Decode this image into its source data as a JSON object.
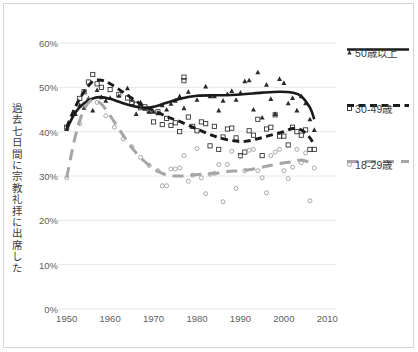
{
  "chart_data": {
    "type": "scatter",
    "title": "",
    "xlabel": "",
    "ylabel": "過去七日間に宗教礼拝に出席した",
    "xlim": [
      1948,
      2012
    ],
    "ylim": [
      0,
      60
    ],
    "grid": true,
    "grid_axis": "y",
    "legend_position": "right",
    "x_ticks": [
      "1950",
      "1960",
      "1970",
      "1980",
      "1990",
      "2000",
      "2010"
    ],
    "x_tick_values": [
      1950,
      1960,
      1970,
      1980,
      1990,
      2000,
      2010
    ],
    "y_ticks": [
      "0%",
      "10%",
      "20%",
      "30%",
      "40%",
      "50%",
      "60%"
    ],
    "y_tick_values": [
      0,
      10,
      20,
      30,
      40,
      50,
      60
    ],
    "series": [
      {
        "name": "50歳以上",
        "color": "#1a1a1a",
        "line_style": "solid",
        "marker": "triangle",
        "points": [
          [
            1950,
            40.6
          ],
          [
            1952,
            44.0
          ],
          [
            1953,
            46.0
          ],
          [
            1954,
            45.4
          ],
          [
            1955,
            47.5
          ],
          [
            1956,
            44.8
          ],
          [
            1957,
            49.4
          ],
          [
            1958,
            47.8
          ],
          [
            1959,
            47.0
          ],
          [
            1960,
            47.6
          ],
          [
            1962,
            48.1
          ],
          [
            1964,
            49.8
          ],
          [
            1965,
            47.2
          ],
          [
            1966,
            44.0
          ],
          [
            1967,
            46.6
          ],
          [
            1968,
            45.2
          ],
          [
            1969,
            44.5
          ],
          [
            1970,
            44.5
          ],
          [
            1971,
            44.2
          ],
          [
            1972,
            46.0
          ],
          [
            1973,
            45.0
          ],
          [
            1974,
            46.3
          ],
          [
            1975,
            47.0
          ],
          [
            1976,
            48.0
          ],
          [
            1977,
            45.3
          ],
          [
            1978,
            49.0
          ],
          [
            1980,
            47.2
          ],
          [
            1982,
            50.2
          ],
          [
            1983,
            48.0
          ],
          [
            1984,
            48.0
          ],
          [
            1985,
            44.8
          ],
          [
            1986,
            47.0
          ],
          [
            1987,
            48.5
          ],
          [
            1988,
            49.2
          ],
          [
            1989,
            47.2
          ],
          [
            1990,
            48.8
          ],
          [
            1991,
            51.4
          ],
          [
            1992,
            51.6
          ],
          [
            1993,
            45.0
          ],
          [
            1994,
            53.4
          ],
          [
            1995,
            43.2
          ],
          [
            1996,
            50.6
          ],
          [
            1997,
            47.4
          ],
          [
            1998,
            44.0
          ],
          [
            1999,
            51.9
          ],
          [
            2000,
            51.0
          ],
          [
            2001,
            46.4
          ],
          [
            2002,
            47.6
          ],
          [
            2003,
            44.8
          ],
          [
            2004,
            48.0
          ],
          [
            2005,
            46.4
          ],
          [
            2006,
            42.8
          ],
          [
            2007,
            40.4
          ]
        ],
        "trend": [
          [
            1950,
            40.6
          ],
          [
            1952,
            44.3
          ],
          [
            1954,
            46.4
          ],
          [
            1956,
            47.5
          ],
          [
            1958,
            47.8
          ],
          [
            1960,
            47.4
          ],
          [
            1963,
            46.4
          ],
          [
            1966,
            45.6
          ],
          [
            1968,
            45.4
          ],
          [
            1970,
            45.6
          ],
          [
            1973,
            46.5
          ],
          [
            1976,
            47.4
          ],
          [
            1980,
            48.1
          ],
          [
            1985,
            48.2
          ],
          [
            1990,
            48.4
          ],
          [
            1995,
            48.8
          ],
          [
            1999,
            49.0
          ],
          [
            2002,
            48.8
          ],
          [
            2004,
            48.0
          ],
          [
            2006,
            45.4
          ],
          [
            2007,
            42.8
          ]
        ]
      },
      {
        "name": "30-49歳",
        "color": "#1a1a1a",
        "line_style": "dashed",
        "marker": "square",
        "points": [
          [
            1950,
            41.0
          ],
          [
            1953,
            47.5
          ],
          [
            1954,
            49.0
          ],
          [
            1955,
            51.2
          ],
          [
            1956,
            52.9
          ],
          [
            1957,
            50.8
          ],
          [
            1958,
            50.0
          ],
          [
            1960,
            49.5
          ],
          [
            1962,
            48.4
          ],
          [
            1964,
            47.6
          ],
          [
            1965,
            46.6
          ],
          [
            1966,
            46.2
          ],
          [
            1967,
            45.4
          ],
          [
            1968,
            45.6
          ],
          [
            1969,
            44.7
          ],
          [
            1970,
            42.2
          ],
          [
            1971,
            44.5
          ],
          [
            1972,
            41.6
          ],
          [
            1973,
            43.0
          ],
          [
            1974,
            41.4
          ],
          [
            1975,
            42.0
          ],
          [
            1976,
            40.0
          ],
          [
            1977,
            51.5
          ],
          [
            1977,
            52.3
          ],
          [
            1978,
            43.3
          ],
          [
            1979,
            41.2
          ],
          [
            1980,
            40.2
          ],
          [
            1981,
            42.2
          ],
          [
            1982,
            41.8
          ],
          [
            1983,
            36.8
          ],
          [
            1984,
            41.2
          ],
          [
            1985,
            36.0
          ],
          [
            1986,
            38.8
          ],
          [
            1987,
            40.6
          ],
          [
            1988,
            40.8
          ],
          [
            1989,
            38.6
          ],
          [
            1990,
            34.6
          ],
          [
            1991,
            35.4
          ],
          [
            1992,
            40.2
          ],
          [
            1993,
            39.2
          ],
          [
            1994,
            42.8
          ],
          [
            1995,
            34.6
          ],
          [
            1996,
            40.6
          ],
          [
            1997,
            41.0
          ],
          [
            1998,
            43.8
          ],
          [
            1999,
            39.0
          ],
          [
            2000,
            39.0
          ],
          [
            2001,
            37.0
          ],
          [
            2002,
            41.0
          ],
          [
            2003,
            40.0
          ],
          [
            2004,
            39.2
          ],
          [
            2005,
            40.4
          ],
          [
            2006,
            36.0
          ],
          [
            2007,
            36.0
          ]
        ],
        "trend": [
          [
            1950,
            41.0
          ],
          [
            1952,
            45.6
          ],
          [
            1954,
            49.0
          ],
          [
            1956,
            51.3
          ],
          [
            1958,
            51.6
          ],
          [
            1960,
            50.8
          ],
          [
            1963,
            48.9
          ],
          [
            1966,
            46.9
          ],
          [
            1968,
            45.6
          ],
          [
            1970,
            44.8
          ],
          [
            1973,
            43.4
          ],
          [
            1976,
            42.3
          ],
          [
            1980,
            40.6
          ],
          [
            1984,
            39.0
          ],
          [
            1988,
            38.0
          ],
          [
            1991,
            37.8
          ],
          [
            1994,
            38.4
          ],
          [
            1997,
            39.2
          ],
          [
            2000,
            40.0
          ],
          [
            2002,
            40.7
          ],
          [
            2004,
            40.4
          ],
          [
            2006,
            38.6
          ],
          [
            2007,
            36.8
          ]
        ]
      },
      {
        "name": "18-29歳",
        "color": "#a6a6a6",
        "line_style": "longdash",
        "marker": "circle",
        "points": [
          [
            1950,
            29.6
          ],
          [
            1953,
            41.8
          ],
          [
            1955,
            47.2
          ],
          [
            1957,
            46.6
          ],
          [
            1959,
            43.6
          ],
          [
            1961,
            41.0
          ],
          [
            1963,
            38.4
          ],
          [
            1965,
            36.6
          ],
          [
            1967,
            34.2
          ],
          [
            1969,
            32.4
          ],
          [
            1971,
            31.2
          ],
          [
            1972,
            27.8
          ],
          [
            1973,
            27.8
          ],
          [
            1974,
            31.6
          ],
          [
            1975,
            31.6
          ],
          [
            1976,
            31.8
          ],
          [
            1977,
            34.6
          ],
          [
            1978,
            28.8
          ],
          [
            1979,
            30.2
          ],
          [
            1980,
            36.2
          ],
          [
            1981,
            29.6
          ],
          [
            1982,
            26.0
          ],
          [
            1983,
            30.4
          ],
          [
            1984,
            30.6
          ],
          [
            1985,
            32.6
          ],
          [
            1986,
            24.2
          ],
          [
            1987,
            32.6
          ],
          [
            1988,
            35.6
          ],
          [
            1989,
            27.2
          ],
          [
            1990,
            34.4
          ],
          [
            1991,
            31.2
          ],
          [
            1992,
            35.8
          ],
          [
            1993,
            36.0
          ],
          [
            1994,
            31.2
          ],
          [
            1995,
            29.6
          ],
          [
            1996,
            26.2
          ],
          [
            1997,
            34.6
          ],
          [
            1998,
            35.4
          ],
          [
            1999,
            36.0
          ],
          [
            2000,
            31.2
          ],
          [
            2001,
            29.4
          ],
          [
            2002,
            32.0
          ],
          [
            2003,
            36.0
          ],
          [
            2004,
            33.0
          ],
          [
            2005,
            35.2
          ],
          [
            2006,
            24.4
          ],
          [
            2007,
            31.8
          ]
        ],
        "trend": [
          [
            1950,
            29.6
          ],
          [
            1952,
            39.0
          ],
          [
            1954,
            45.0
          ],
          [
            1956,
            47.2
          ],
          [
            1958,
            46.2
          ],
          [
            1960,
            43.6
          ],
          [
            1963,
            39.2
          ],
          [
            1966,
            35.2
          ],
          [
            1969,
            32.4
          ],
          [
            1972,
            30.6
          ],
          [
            1975,
            30.0
          ],
          [
            1978,
            30.1
          ],
          [
            1981,
            30.4
          ],
          [
            1984,
            30.6
          ],
          [
            1987,
            31.0
          ],
          [
            1990,
            31.2
          ],
          [
            1993,
            31.6
          ],
          [
            1996,
            32.2
          ],
          [
            1999,
            32.8
          ],
          [
            2002,
            33.2
          ],
          [
            2004,
            33.6
          ],
          [
            2006,
            33.0
          ],
          [
            2007,
            32.6
          ]
        ]
      }
    ]
  },
  "legend": {
    "items": [
      {
        "label": "50歳以上",
        "marker": "triangle-marker",
        "line_style": "solid",
        "color": "#1a1a1a"
      },
      {
        "label": "30-49歳",
        "marker": "square-marker",
        "line_style": "dashed",
        "color": "#1a1a1a"
      },
      {
        "label": "18-29歳",
        "marker": "circle-marker",
        "line_style": "longdash",
        "color": "#a6a6a6"
      }
    ]
  },
  "axes": {
    "y_title": "過去七日間に宗教礼拝に出席した"
  }
}
